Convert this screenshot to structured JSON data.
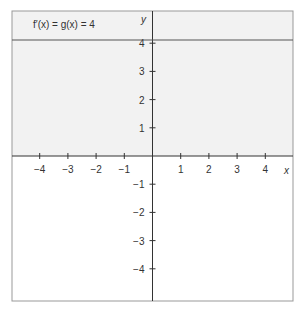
{
  "chart_data": {
    "type": "line",
    "title": "",
    "annotation": "f′(x) = g(x) = 4",
    "xlabel": "x",
    "ylabel": "y",
    "xlim": [
      -5,
      5
    ],
    "ylim": [
      -5,
      5
    ],
    "x_ticks": [
      -4,
      -3,
      -2,
      -1,
      1,
      2,
      3,
      4
    ],
    "y_ticks": [
      -4,
      -3,
      -2,
      -1,
      1,
      2,
      3,
      4
    ],
    "x_tick_labels": [
      "−4",
      "−3",
      "−2",
      "−1",
      "1",
      "2",
      "3",
      "4"
    ],
    "y_tick_labels": [
      "−4",
      "−3",
      "−2",
      "−1",
      "1",
      "2",
      "3",
      "4"
    ],
    "grid": false,
    "shaded_region": "upper half-plane (y > 0)",
    "series": [
      {
        "name": "f′(x) = g(x) = 4",
        "x": [
          -5,
          5
        ],
        "y": [
          4,
          4
        ]
      }
    ]
  },
  "colors": {
    "shade": "#f2f2f2",
    "axis": "#333333",
    "border": "#999999"
  }
}
